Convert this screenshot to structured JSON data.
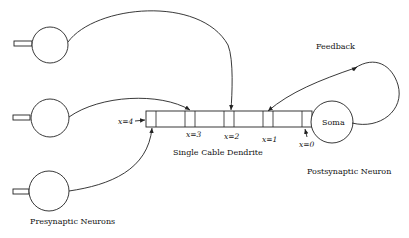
{
  "diagram": {
    "title_labels": {
      "presynaptic": "Presynaptic Neurons",
      "postsynaptic": "Postsynaptic Neuron",
      "dendrite": "Single Cable Dendrite",
      "feedback": "Feedback",
      "soma": "Soma"
    },
    "positions": {
      "x4": "x=4",
      "x3": "x=3",
      "x2": "x=2",
      "x1": "x=1",
      "x0": "x=0"
    },
    "presynaptic_neurons": [
      {
        "id": "top",
        "targets": "x=2"
      },
      {
        "id": "middle",
        "targets": "x=3"
      },
      {
        "id": "bottom",
        "targets": "x=4"
      }
    ],
    "feedback_target": "x=1",
    "colors": {
      "line": "#222222",
      "background": "#ffffff"
    }
  }
}
